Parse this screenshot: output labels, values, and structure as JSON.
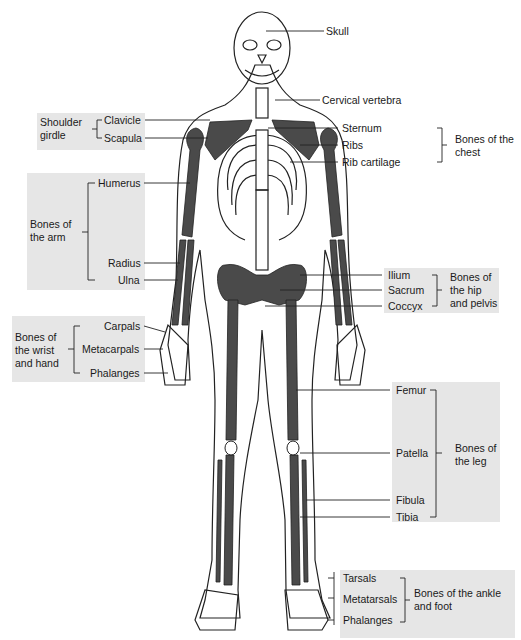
{
  "diagram": {
    "colors": {
      "bone_dark": "#4a4a4a",
      "bone_light": "#ffffff",
      "outline": "#222222",
      "group_box": "#e6e6e6"
    },
    "labels": {
      "skull": "Skull",
      "cervical_vertebra": "Cervical vertebra",
      "clavicle": "Clavicle",
      "scapula": "Scapula",
      "sternum": "Sternum",
      "ribs": "Ribs",
      "rib_cartilage": "Rib cartilage",
      "humerus": "Humerus",
      "radius": "Radius",
      "ulna": "Ulna",
      "ilium": "Ilium",
      "sacrum": "Sacrum",
      "coccyx": "Coccyx",
      "carpals": "Carpals",
      "metacarpals": "Metacarpals",
      "phalanges_hand": "Phalanges",
      "femur": "Femur",
      "patella": "Patella",
      "fibula": "Fibula",
      "tibia": "Tibia",
      "tarsals": "Tarsals",
      "metatarsals": "Metatarsals",
      "phalanges_foot": "Phalanges"
    },
    "groups": {
      "shoulder_girdle": "Shoulder girdle",
      "chest": "Bones of the chest",
      "arm": "Bones of the arm",
      "hip_pelvis": "Bones of the hip and pelvis",
      "wrist_hand": "Bones of the wrist and hand",
      "leg": "Bones of the leg",
      "ankle_foot": "Bones of the ankle and foot"
    }
  }
}
